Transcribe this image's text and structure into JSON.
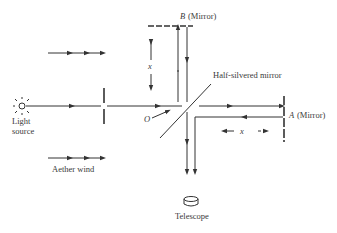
{
  "diagram": {
    "labels": {
      "mirror_b_letter": "B",
      "mirror_b_text": "(Mirror)",
      "mirror_a_letter": "A",
      "mirror_a_text": "(Mirror)",
      "half_silvered": "Half-silvered mirror",
      "origin": "O",
      "light_source_line1": "Light",
      "light_source_line2": "source",
      "aether_wind": "Aether wind",
      "telescope": "Telescope",
      "distance_vertical": "x",
      "distance_horizontal": "x"
    },
    "colors": {
      "ink": "#333333",
      "text": "#3a3a3a",
      "background": "#ffffff"
    }
  }
}
